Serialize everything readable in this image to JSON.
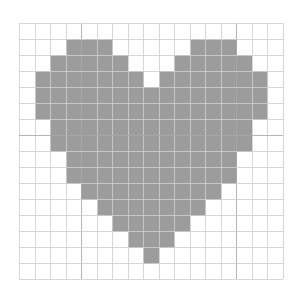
{
  "figure": {
    "grid": {
      "columns": 17,
      "rows": 16,
      "origin_px": [
        19,
        23
      ],
      "cell_width_px": 15.53,
      "cell_height_px": 16,
      "line_color": "#cfcfcf",
      "major_line_color": "#a8a8a8",
      "major_vertical_lines": [
        4,
        14
      ],
      "major_horizontal_lines": [
        7
      ]
    },
    "fill_color": "#9c9c9c",
    "background_color": "#ffffff",
    "filled_cells_by_row": [
      [],
      [
        [
          3,
          5
        ],
        [
          11,
          13
        ]
      ],
      [
        [
          2,
          6
        ],
        [
          10,
          14
        ]
      ],
      [
        [
          1,
          7
        ],
        [
          9,
          15
        ]
      ],
      [
        [
          1,
          15
        ]
      ],
      [
        [
          1,
          15
        ]
      ],
      [
        [
          2,
          14
        ]
      ],
      [
        [
          2,
          14
        ]
      ],
      [
        [
          3,
          13
        ]
      ],
      [
        [
          3,
          13
        ]
      ],
      [
        [
          4,
          12
        ]
      ],
      [
        [
          5,
          11
        ]
      ],
      [
        [
          6,
          10
        ]
      ],
      [
        [
          7,
          9
        ]
      ],
      [
        [
          8,
          8
        ]
      ],
      []
    ]
  }
}
